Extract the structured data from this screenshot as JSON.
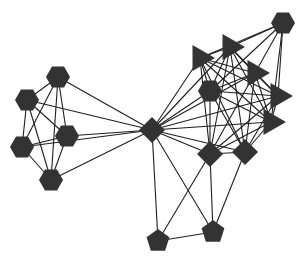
{
  "diagram": {
    "type": "network-graph",
    "background": "#ffffff",
    "node_color": "#333333",
    "edge_color": "#1f1f1f",
    "nodes": [
      {
        "id": "A",
        "shape": "hexagon",
        "x": 58,
        "y": 77
      },
      {
        "id": "B",
        "shape": "hexagon",
        "x": 27,
        "y": 100
      },
      {
        "id": "C",
        "shape": "hexagon",
        "x": 67,
        "y": 136
      },
      {
        "id": "D",
        "shape": "hexagon",
        "x": 22,
        "y": 147
      },
      {
        "id": "E",
        "shape": "hexagon",
        "x": 51,
        "y": 180
      },
      {
        "id": "F",
        "shape": "diamond",
        "x": 152,
        "y": 130
      },
      {
        "id": "G",
        "shape": "hexagon",
        "x": 283,
        "y": 23
      },
      {
        "id": "T1",
        "shape": "triangle",
        "x": 200,
        "y": 58
      },
      {
        "id": "T2",
        "shape": "triangle",
        "x": 230,
        "y": 47
      },
      {
        "id": "T3",
        "shape": "triangle",
        "x": 255,
        "y": 73
      },
      {
        "id": "T4",
        "shape": "triangle",
        "x": 278,
        "y": 96
      },
      {
        "id": "T5",
        "shape": "triangle",
        "x": 271,
        "y": 122
      },
      {
        "id": "H",
        "shape": "hexagon",
        "x": 210,
        "y": 91
      },
      {
        "id": "K",
        "shape": "diamond",
        "x": 210,
        "y": 154
      },
      {
        "id": "L",
        "shape": "diamond",
        "x": 245,
        "y": 152
      },
      {
        "id": "P1",
        "shape": "pentagon",
        "x": 158,
        "y": 241
      },
      {
        "id": "P2",
        "shape": "pentagon",
        "x": 213,
        "y": 232
      }
    ],
    "edges": [
      [
        "A",
        "B"
      ],
      [
        "A",
        "C"
      ],
      [
        "A",
        "D"
      ],
      [
        "A",
        "E"
      ],
      [
        "B",
        "C"
      ],
      [
        "B",
        "D"
      ],
      [
        "B",
        "E"
      ],
      [
        "C",
        "D"
      ],
      [
        "C",
        "E"
      ],
      [
        "D",
        "E"
      ],
      [
        "A",
        "F"
      ],
      [
        "B",
        "F"
      ],
      [
        "C",
        "F"
      ],
      [
        "D",
        "F"
      ],
      [
        "E",
        "F"
      ],
      [
        "F",
        "T1"
      ],
      [
        "F",
        "T2"
      ],
      [
        "F",
        "H"
      ],
      [
        "F",
        "T3"
      ],
      [
        "F",
        "T4"
      ],
      [
        "F",
        "T5"
      ],
      [
        "F",
        "K"
      ],
      [
        "F",
        "L"
      ],
      [
        "F",
        "P1"
      ],
      [
        "F",
        "P2"
      ],
      [
        "G",
        "T1"
      ],
      [
        "G",
        "T2"
      ],
      [
        "G",
        "T3"
      ],
      [
        "G",
        "H"
      ],
      [
        "G",
        "T4"
      ],
      [
        "G",
        "T5"
      ],
      [
        "T1",
        "T2"
      ],
      [
        "T1",
        "T3"
      ],
      [
        "T1",
        "T4"
      ],
      [
        "T1",
        "T5"
      ],
      [
        "T1",
        "H"
      ],
      [
        "T1",
        "K"
      ],
      [
        "T1",
        "L"
      ],
      [
        "T2",
        "T3"
      ],
      [
        "T2",
        "T4"
      ],
      [
        "T2",
        "T5"
      ],
      [
        "T2",
        "H"
      ],
      [
        "T2",
        "K"
      ],
      [
        "T2",
        "L"
      ],
      [
        "T3",
        "T4"
      ],
      [
        "T3",
        "T5"
      ],
      [
        "T3",
        "H"
      ],
      [
        "T3",
        "K"
      ],
      [
        "T3",
        "L"
      ],
      [
        "T4",
        "T5"
      ],
      [
        "T4",
        "H"
      ],
      [
        "T4",
        "K"
      ],
      [
        "T4",
        "L"
      ],
      [
        "T5",
        "H"
      ],
      [
        "T5",
        "K"
      ],
      [
        "T5",
        "L"
      ],
      [
        "H",
        "K"
      ],
      [
        "H",
        "L"
      ],
      [
        "K",
        "L"
      ],
      [
        "K",
        "P1"
      ],
      [
        "K",
        "P2"
      ],
      [
        "L",
        "P2"
      ],
      [
        "P1",
        "P2"
      ]
    ]
  }
}
